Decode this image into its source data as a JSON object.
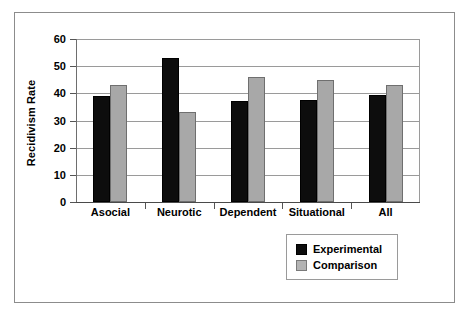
{
  "chart_data": {
    "type": "bar",
    "title": "",
    "xlabel": "",
    "ylabel": "Recidivism Rate",
    "ylim": [
      0,
      60
    ],
    "yticks": [
      0,
      10,
      20,
      30,
      40,
      50,
      60
    ],
    "ytick_labels": [
      "0",
      "10",
      "20",
      "30",
      "40",
      "50",
      "60"
    ],
    "grid": true,
    "grid_axis": "y",
    "legend_position": "bottom-right",
    "categories": [
      "Asocial",
      "Neurotic",
      "Dependent",
      "Situational",
      "All"
    ],
    "series": [
      {
        "name": "Experimental",
        "color": "#0d0d0d",
        "values": [
          39,
          53,
          37,
          37.5,
          39.5
        ]
      },
      {
        "name": "Comparison",
        "color": "#a8a8a8",
        "values": [
          43,
          33,
          46,
          45,
          43
        ]
      }
    ]
  },
  "legend": {
    "entries": [
      {
        "label": "Experimental",
        "swatch": "black-square"
      },
      {
        "label": "Comparison",
        "swatch": "gray-square"
      }
    ]
  }
}
